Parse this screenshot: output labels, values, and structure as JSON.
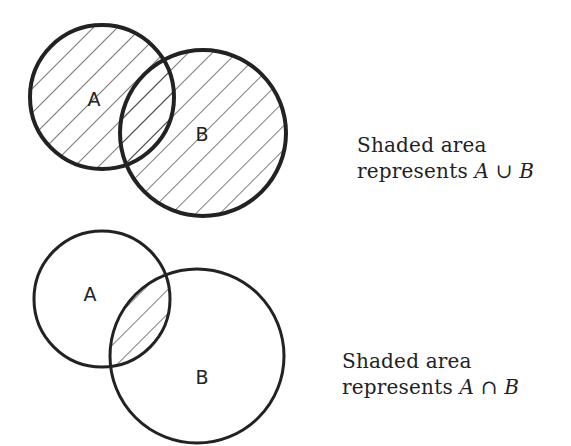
{
  "figures": [
    {
      "id": "union",
      "circles": [
        {
          "label": "A",
          "cx": 102,
          "cy": 97,
          "r": 72
        },
        {
          "label": "B",
          "cx": 203,
          "cy": 133,
          "r": 83
        }
      ],
      "label_positions": {
        "A": [
          94,
          106
        ],
        "B": [
          202,
          141
        ]
      },
      "caption": {
        "line1": "Shaded area",
        "line2_prefix": "represents",
        "math": "A ∪ B"
      },
      "shading": "union"
    },
    {
      "id": "intersection",
      "circles": [
        {
          "label": "A",
          "cx": 102,
          "cy": 299,
          "r": 68
        },
        {
          "label": "B",
          "cx": 197,
          "cy": 356,
          "r": 87
        }
      ],
      "label_positions": {
        "A": [
          90,
          301
        ],
        "B": [
          202,
          384
        ]
      },
      "caption": {
        "line1": "Shaded area",
        "line2_prefix": "represents",
        "math": "A ∩ B"
      },
      "shading": "intersection"
    }
  ],
  "style": {
    "stroke_color": "#222222",
    "stroke_width": 4,
    "hatch_color": "#333333",
    "hatch_spacing": 17
  }
}
